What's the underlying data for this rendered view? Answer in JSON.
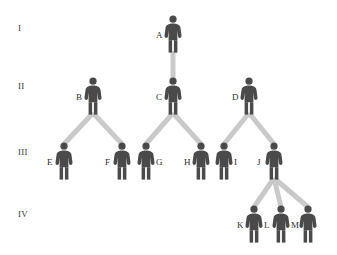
{
  "diagram": {
    "type": "pedigree-tree",
    "colors": {
      "figure": "#4a4a4a",
      "connector": "#c9c9c9",
      "label": "#2e2e2e",
      "background": "#ffffff"
    },
    "generation_labels": [
      {
        "text": "I",
        "x": 18,
        "y": 24
      },
      {
        "text": "II",
        "x": 18,
        "y": 82
      },
      {
        "text": "III",
        "x": 18,
        "y": 148
      },
      {
        "text": "IV",
        "x": 18,
        "y": 210
      }
    ],
    "people": [
      {
        "id": "A",
        "label": "A",
        "generation": "I",
        "x": 164,
        "y": 15,
        "label_side": "left"
      },
      {
        "id": "B",
        "label": "B",
        "generation": "II",
        "x": 84,
        "y": 77,
        "label_side": "left"
      },
      {
        "id": "C",
        "label": "C",
        "generation": "II",
        "x": 164,
        "y": 77,
        "label_side": "left"
      },
      {
        "id": "D",
        "label": "D",
        "generation": "II",
        "x": 240,
        "y": 77,
        "label_side": "left"
      },
      {
        "id": "E",
        "label": "E",
        "generation": "III",
        "x": 55,
        "y": 142,
        "label_side": "left"
      },
      {
        "id": "F",
        "label": "F",
        "generation": "III",
        "x": 113,
        "y": 142,
        "label_side": "left"
      },
      {
        "id": "G",
        "label": "G",
        "generation": "III",
        "x": 137,
        "y": 142,
        "label_side": "right"
      },
      {
        "id": "H",
        "label": "H",
        "generation": "III",
        "x": 192,
        "y": 142,
        "label_side": "left"
      },
      {
        "id": "I",
        "label": "I",
        "generation": "III",
        "x": 215,
        "y": 142,
        "label_side": "right"
      },
      {
        "id": "J",
        "label": "J",
        "generation": "III",
        "x": 265,
        "y": 142,
        "label_side": "left"
      },
      {
        "id": "K",
        "label": "K",
        "generation": "IV",
        "x": 245,
        "y": 205,
        "label_side": "left"
      },
      {
        "id": "L",
        "label": "L",
        "generation": "IV",
        "x": 272,
        "y": 205,
        "label_side": "left"
      },
      {
        "id": "M",
        "label": "M",
        "generation": "IV",
        "x": 299,
        "y": 205,
        "label_side": "left"
      }
    ],
    "edges": [
      {
        "from": "A",
        "to": "C",
        "kind": "vertical"
      },
      {
        "from": "B",
        "to": "E",
        "kind": "diagonal"
      },
      {
        "from": "B",
        "to": "F",
        "kind": "diagonal"
      },
      {
        "from": "C",
        "to": "G",
        "kind": "diagonal"
      },
      {
        "from": "C",
        "to": "H",
        "kind": "diagonal"
      },
      {
        "from": "D",
        "to": "I",
        "kind": "diagonal"
      },
      {
        "from": "D",
        "to": "J",
        "kind": "diagonal"
      },
      {
        "from": "J",
        "to": "K",
        "kind": "diagonal"
      },
      {
        "from": "J",
        "to": "L",
        "kind": "vertical"
      },
      {
        "from": "J",
        "to": "M",
        "kind": "diagonal"
      }
    ]
  }
}
